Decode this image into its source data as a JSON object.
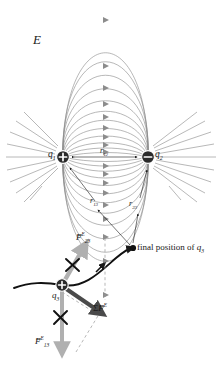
{
  "figure": {
    "background": "#ffffff"
  },
  "labels": {
    "field_label": "E",
    "charge1": "q",
    "charge1_sub": "1",
    "charge2": "q",
    "charge2_sub": "2",
    "charge3": "q",
    "charge3_sub": "3",
    "r12": "r",
    "r12_sub": "12",
    "r13": "r",
    "r13_sub": "13",
    "r23": "r",
    "r23_sub": "23",
    "final_position_prefix": "final position of ",
    "final_position_symbol": "q",
    "final_position_sub": "3",
    "force23_symbol": "F",
    "force23_sup": "E",
    "force23_sub": "23",
    "force13_symbol": "F",
    "force13_sup": "E",
    "force13_sub": "13",
    "sum_force_sigma": "Σ",
    "sum_force_symbol": "F",
    "sum_force_sup": "E",
    "vector_bar": "→",
    "plus_sign": "+",
    "minus_sign": "−"
  },
  "colors": {
    "field_line": "#8c8c8c",
    "charge_fill": "#2b2b2b",
    "trajectory": "#111111",
    "force_vector": "#b0b0b0",
    "net_force_vector": "#4a4a4a",
    "cross_mark": "#111111",
    "text": "#1a1a1a",
    "dashed_guide": "#9a9a9a"
  },
  "geometry": {
    "charge1_position": {
      "x": 63,
      "y": 157
    },
    "charge2_position": {
      "x": 148,
      "y": 157
    },
    "charge3_position": {
      "x": 62,
      "y": 285
    },
    "final_position": {
      "x": 133,
      "y": 248
    },
    "charge1_sign": "positive",
    "charge2_sign": "negative",
    "charge3_sign": "positive"
  },
  "annotations": {
    "cross_upper": "×",
    "cross_lower": "×"
  }
}
